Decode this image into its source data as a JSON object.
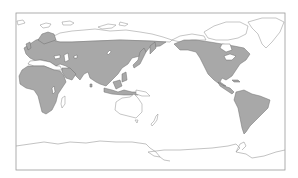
{
  "map": {
    "projection": "pacific-centered world map",
    "frame": {
      "x": 16,
      "y": 13,
      "width": 269,
      "height": 157
    },
    "colors": {
      "background": "#ffffff",
      "frame": "#9a9a9a",
      "land_outline": "#8c8c8c",
      "distribution_fill": "#a8a8a8",
      "distribution_outline": "#6e6e6e"
    },
    "shaded_regions": [
      "Europe",
      "Northern & Central Asia",
      "South & Southeast Asia",
      "Africa",
      "North America",
      "Central America",
      "South America"
    ],
    "unshaded_regions": [
      "Greenland",
      "Arctic islands",
      "Australia",
      "New Zealand",
      "Antarctica",
      "Pacific islands"
    ]
  }
}
